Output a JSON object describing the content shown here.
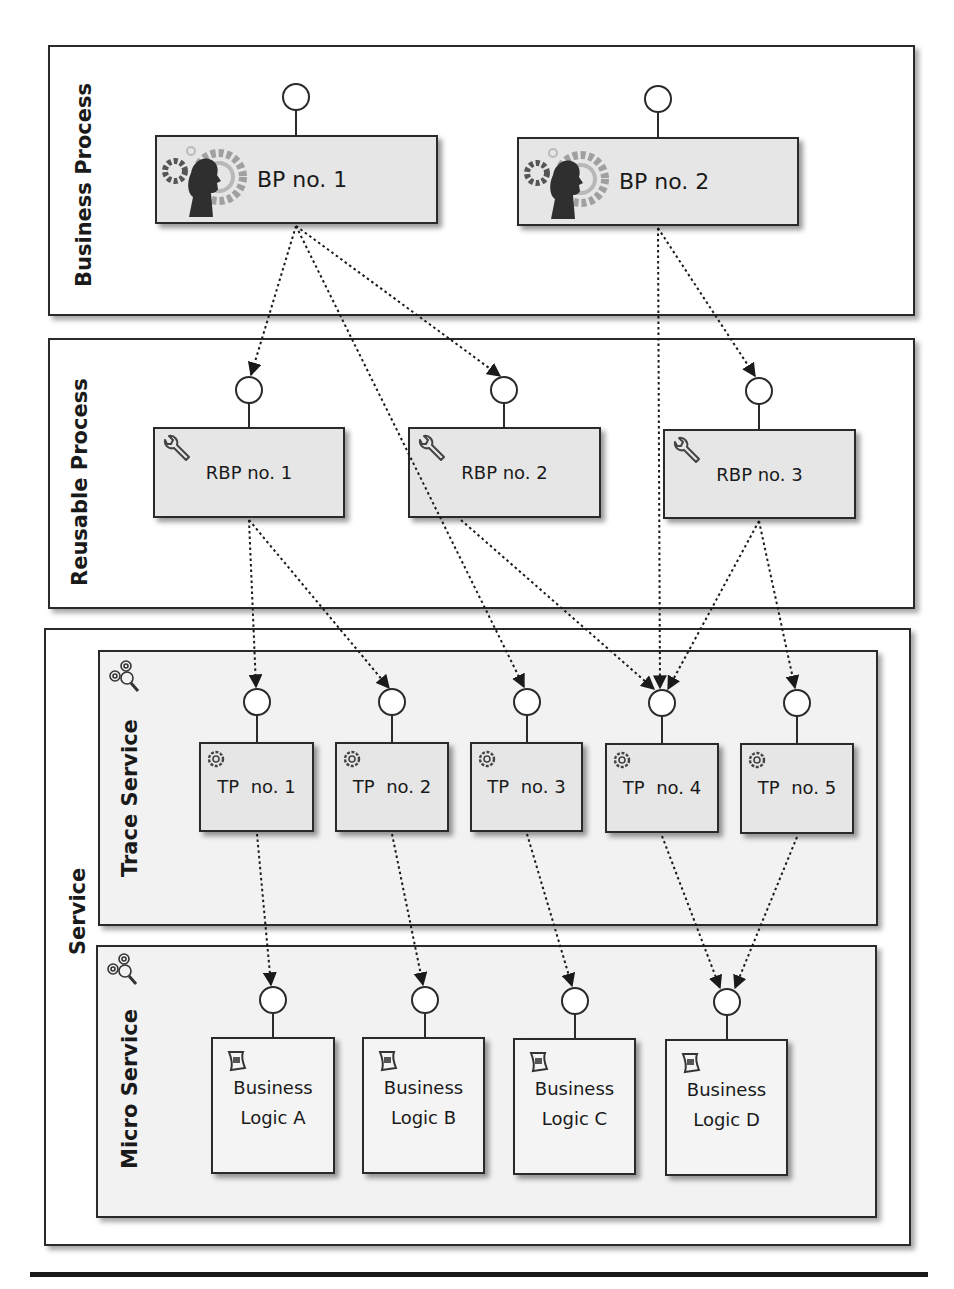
{
  "lanes": {
    "business_process": {
      "title": "Business Process"
    },
    "reusable_process": {
      "title": "Reusable Process"
    },
    "service": {
      "title": "Service"
    },
    "trace_service": {
      "title": "Trace Service",
      "icon": "gears-magnifier-icon"
    },
    "micro_service": {
      "title": "Micro Service",
      "icon": "gears-magnifier-icon"
    }
  },
  "business_processes": [
    {
      "id": "BP1",
      "label": "BP no. 1",
      "icon": "person-gear-icon"
    },
    {
      "id": "BP2",
      "label": "BP no. 2",
      "icon": "person-gear-icon"
    }
  ],
  "reusable_processes": [
    {
      "id": "RBP1",
      "label": "RBP no. 1",
      "icon": "wrench-icon"
    },
    {
      "id": "RBP2",
      "label": "RBP no. 2",
      "icon": "wrench-icon"
    },
    {
      "id": "RBP3",
      "label": "RBP no. 3",
      "icon": "wrench-icon"
    }
  ],
  "trace_processes": [
    {
      "id": "TP1",
      "label": "TP  no. 1",
      "icon": "gear-icon"
    },
    {
      "id": "TP2",
      "label": "TP  no. 2",
      "icon": "gear-icon"
    },
    {
      "id": "TP3",
      "label": "TP  no. 3",
      "icon": "gear-icon"
    },
    {
      "id": "TP4",
      "label": "TP  no. 4",
      "icon": "gear-icon"
    },
    {
      "id": "TP5",
      "label": "TP  no. 5",
      "icon": "gear-icon"
    }
  ],
  "business_logic": [
    {
      "id": "BLA",
      "line1": "Business",
      "line2": "Logic A",
      "icon": "script-icon"
    },
    {
      "id": "BLB",
      "line1": "Business",
      "line2": "Logic B",
      "icon": "script-icon"
    },
    {
      "id": "BLC",
      "line1": "Business",
      "line2": "Logic C",
      "icon": "script-icon"
    },
    {
      "id": "BLD",
      "line1": "Business",
      "line2": "Logic D",
      "icon": "script-icon"
    }
  ],
  "connections": [
    {
      "from": "BP1",
      "to": "RBP1"
    },
    {
      "from": "BP1",
      "to": "RBP2"
    },
    {
      "from": "BP1",
      "to": "TP3"
    },
    {
      "from": "BP2",
      "to": "RBP3"
    },
    {
      "from": "BP2",
      "to": "TP4"
    },
    {
      "from": "RBP1",
      "to": "TP1"
    },
    {
      "from": "RBP1",
      "to": "TP2"
    },
    {
      "from": "RBP2",
      "to": "TP4"
    },
    {
      "from": "RBP3",
      "to": "TP4"
    },
    {
      "from": "RBP3",
      "to": "TP5"
    },
    {
      "from": "TP1",
      "to": "BLA"
    },
    {
      "from": "TP2",
      "to": "BLB"
    },
    {
      "from": "TP3",
      "to": "BLC"
    },
    {
      "from": "TP4",
      "to": "BLD"
    },
    {
      "from": "TP5",
      "to": "BLD"
    }
  ],
  "colors": {
    "line": "#2a2a2a",
    "node_fill": "#e6e6e6",
    "inner_lane_fill": "#f2f2f2"
  }
}
